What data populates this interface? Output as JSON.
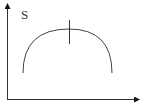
{
  "diagram": {
    "y_axis_label": "S",
    "x_axis_label": "",
    "curve": "inverted parabola (concave down arc) with a vertical marker at its peak",
    "colors": {
      "line": "#333333",
      "background": "#ffffff"
    }
  }
}
